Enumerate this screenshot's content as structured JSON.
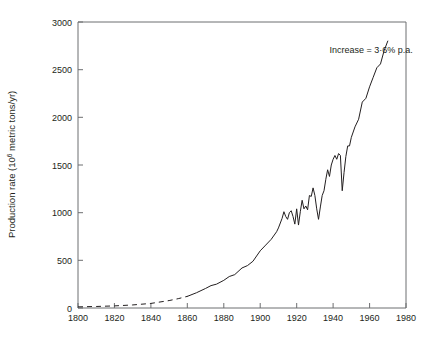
{
  "chart_data": {
    "type": "line",
    "title": "",
    "xlabel": "",
    "ylabel": "Production rate (10⁶ metric tons/yr)",
    "ylabel_parts": {
      "before": "Production rate (10",
      "sup": "6",
      "after": " metric tons/yr)"
    },
    "xlim": [
      1800,
      1980
    ],
    "ylim": [
      0,
      3000
    ],
    "xticks": [
      1800,
      1820,
      1840,
      1860,
      1880,
      1900,
      1920,
      1940,
      1960,
      1980
    ],
    "yticks": [
      0,
      500,
      1000,
      1500,
      2000,
      2500,
      3000
    ],
    "xtick_labels": [
      "1800",
      "1820",
      "1840",
      "1860",
      "1880",
      "1900",
      "1920",
      "1940",
      "1960",
      "1980"
    ],
    "ytick_labels": [
      "0",
      "500",
      "1000",
      "1500",
      "2000",
      "2500",
      "3000"
    ],
    "grid": false,
    "legend": null,
    "tick_direction": "in",
    "annotations": [
      {
        "text": "Increase = 3·6% p.a.",
        "x": 1938,
        "y": 2680
      }
    ],
    "series": [
      {
        "name": "Estimated production rate (dashed)",
        "style": "dashed",
        "color": "#231f20",
        "x": [
          1800,
          1810,
          1820,
          1830,
          1840,
          1850,
          1855,
          1860
        ],
        "values": [
          12,
          16,
          22,
          32,
          48,
          78,
          98,
          122
        ]
      },
      {
        "name": "Production rate (solid)",
        "style": "solid",
        "color": "#231f20",
        "x": [
          1860,
          1865,
          1870,
          1873,
          1876,
          1880,
          1883,
          1886,
          1890,
          1893,
          1896,
          1900,
          1903,
          1906,
          1909,
          1910,
          1912,
          1913,
          1914,
          1915,
          1916,
          1917,
          1918,
          1919,
          1920,
          1921,
          1922,
          1923,
          1924,
          1925,
          1926,
          1927,
          1928,
          1929,
          1930,
          1931,
          1932,
          1933,
          1934,
          1935,
          1936,
          1937,
          1938,
          1939,
          1940,
          1941,
          1942,
          1943,
          1944,
          1945,
          1946,
          1947,
          1948,
          1949,
          1950,
          1952,
          1954,
          1956,
          1958,
          1960,
          1962,
          1964,
          1966,
          1968,
          1970
        ],
        "values": [
          122,
          160,
          205,
          235,
          250,
          290,
          330,
          350,
          420,
          445,
          490,
          600,
          660,
          720,
          800,
          840,
          940,
          1010,
          960,
          930,
          1000,
          1020,
          960,
          880,
          1040,
          870,
          1010,
          1130,
          1040,
          1070,
          1030,
          1180,
          1170,
          1260,
          1180,
          1040,
          930,
          1060,
          1180,
          1230,
          1350,
          1450,
          1380,
          1500,
          1560,
          1600,
          1560,
          1620,
          1600,
          1230,
          1420,
          1590,
          1700,
          1700,
          1790,
          1900,
          1980,
          2160,
          2200,
          2320,
          2420,
          2520,
          2560,
          2700,
          2800
        ]
      }
    ]
  }
}
